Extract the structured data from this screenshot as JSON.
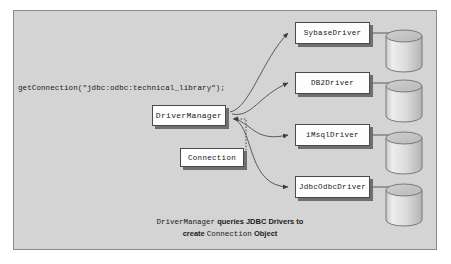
{
  "diagram": {
    "code_call": "getConnection(\"jdbc:odbc:technical_library\");",
    "manager": {
      "label": "DriverManager"
    },
    "connection": {
      "label": "Connection"
    },
    "drivers": [
      {
        "label": "SybaseDriver"
      },
      {
        "label": "DB2Driver"
      },
      {
        "label": "iMsqlDriver"
      },
      {
        "label": "JdbcOdbcDriver"
      }
    ],
    "databases": [
      {
        "name": "database-cylinder-1"
      },
      {
        "name": "database-cylinder-2"
      },
      {
        "name": "database-cylinder-3"
      },
      {
        "name": "database-cylinder-4"
      }
    ],
    "caption": {
      "line1_part1": "DriverManager",
      "line1_part2": " queries JDBC Drivers to",
      "line2_part1": "create ",
      "line2_part2": "Connection",
      "line2_part3": " Object"
    },
    "colors": {
      "panel_background": "#d4d4d4",
      "panel_border": "#8a8a8a",
      "node_fill": "#fdfdfd",
      "node_border": "#4a4a4a",
      "node_shadow": "#6f6f6f",
      "connector": "#5a5a5a",
      "cylinder_fill": "#d9d9d9",
      "cylinder_top": "#c2c2c2",
      "text": "#1b1b1b"
    }
  }
}
